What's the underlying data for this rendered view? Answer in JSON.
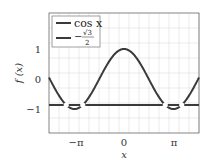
{
  "chart_data": {
    "type": "line",
    "title": "",
    "xlabel": "x",
    "ylabel": "f(x)",
    "xlim": [
      -4.76,
      4.76
    ],
    "ylim": [
      -1.8,
      2.2
    ],
    "grid": true,
    "legend_position": "upper left",
    "x_ticks": [
      "−π",
      "0",
      "π"
    ],
    "y_ticks": [
      "−1",
      "0",
      "1"
    ],
    "series": [
      {
        "name": "cos x",
        "function": "cos(x)",
        "color": "#3a3a3a"
      },
      {
        "name": "−√3/2",
        "function": "-0.866",
        "color": "#3a3a3a"
      }
    ],
    "annotations": [
      "Intersections near x = ±5π/6 and ±7π/6 marked with white gaps"
    ]
  },
  "legend": {
    "item1": "cos x",
    "item2_sign": "−",
    "item2_num": "√3",
    "item2_den": "2"
  },
  "axis": {
    "xlabel": "x",
    "ylabel": "f (x)",
    "xt": [
      "−π",
      "0",
      "π"
    ],
    "yt": [
      "1",
      "0",
      "−1"
    ]
  }
}
